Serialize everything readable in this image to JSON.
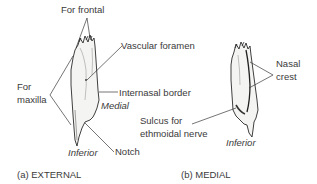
{
  "panels": [
    {
      "caption": "(a) EXTERNAL",
      "labels": {
        "for_frontal": "For frontal",
        "vascular_foramen": "Vascular foramen",
        "internasal_border": "Internasal border",
        "for_maxilla_line1": "For",
        "for_maxilla_line2": "maxilla",
        "medial": "Medial",
        "inferior": "Inferior",
        "notch": "Notch"
      }
    },
    {
      "caption": "(b) MEDIAL",
      "labels": {
        "nasal_crest_line1": "Nasal",
        "nasal_crest_line2": "crest",
        "sulcus_line1": "Sulcus for",
        "sulcus_line2": "ethmoidal nerve",
        "inferior": "Inferior"
      }
    }
  ],
  "colors": {
    "line": "#3a3a3a",
    "bone_fill": "#f4f4f2",
    "bone_outline": "#2a2a2a"
  }
}
